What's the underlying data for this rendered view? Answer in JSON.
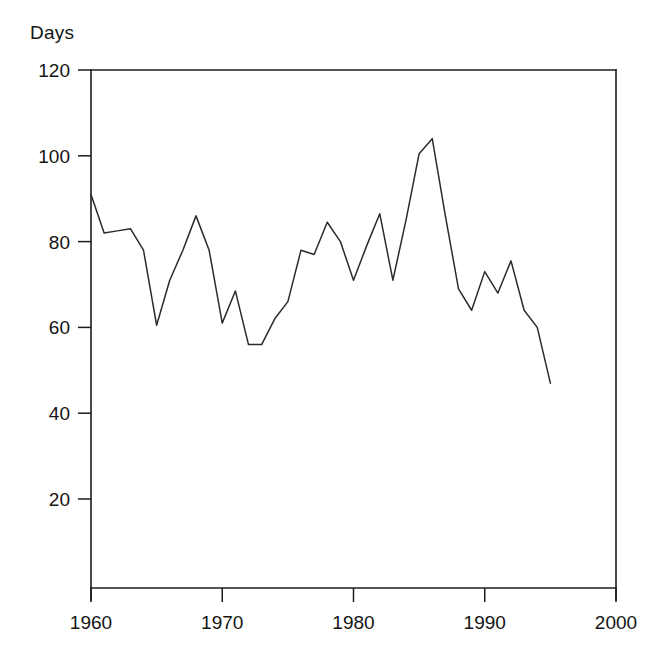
{
  "chart_data": {
    "type": "line",
    "title": "",
    "subtitle": "",
    "ylabel": "Days",
    "xlabel": "",
    "xlim": [
      1960,
      2000
    ],
    "ylim": [
      0,
      120
    ],
    "grid": false,
    "legend": null,
    "annotations": [],
    "xticks": [
      1960,
      1970,
      1980,
      1990,
      2000
    ],
    "xticklabels": [
      "1960",
      "1970",
      "1980",
      "1990",
      "2000"
    ],
    "yticks": [
      20,
      40,
      60,
      80,
      100,
      120
    ],
    "yticklabels": [
      "20",
      "40",
      "60",
      "80",
      "100",
      "120"
    ],
    "line_color": "#2b2b2b",
    "series": [
      {
        "name": "Days",
        "x": [
          1960,
          1961,
          1962,
          1963,
          1964,
          1965,
          1966,
          1967,
          1968,
          1969,
          1970,
          1971,
          1972,
          1973,
          1974,
          1975,
          1976,
          1977,
          1978,
          1979,
          1980,
          1981,
          1982,
          1983,
          1984,
          1985,
          1986,
          1987,
          1988,
          1989,
          1990,
          1991,
          1992,
          1993,
          1994,
          1995
        ],
        "values": [
          91,
          82,
          82.5,
          83,
          78,
          60.5,
          71,
          78,
          86,
          78,
          61,
          68.5,
          56,
          56,
          62,
          66,
          78,
          77,
          84.5,
          80,
          71,
          79,
          86.5,
          71,
          85,
          100.5,
          104,
          86,
          69,
          64,
          73,
          68,
          75.5,
          64,
          60,
          47
        ]
      }
    ]
  },
  "axis": {
    "y_axis_name": "vertical-axis",
    "x_axis_name": "horizontal-axis"
  }
}
